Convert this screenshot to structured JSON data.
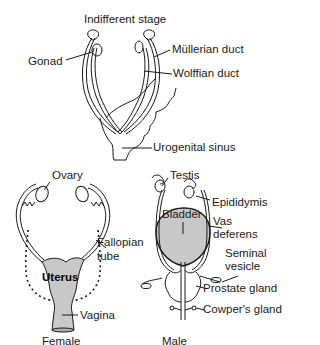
{
  "diagram": {
    "sections": {
      "indifferent": {
        "title": "Indifferent stage",
        "labels": {
          "gonad": "Gonad",
          "mullerian": "Müllerian duct",
          "wolffian": "Wolffian duct",
          "urogenital": "Urogenital sinus"
        }
      },
      "female": {
        "caption": "Female",
        "labels": {
          "ovary": "Ovary",
          "fallopian_1": "Fallopian",
          "fallopian_2": "tube",
          "uterus": "Uterus",
          "vagina": "Vagina"
        }
      },
      "male": {
        "caption": "Male",
        "labels": {
          "testis": "Testis",
          "epididymis": "Epididymis",
          "bladder": "Bladder",
          "vas_1": "Vas",
          "vas_2": "deferens",
          "seminal_1": "Seminal",
          "seminal_2": "vesicle",
          "prostate": "Prostate gland",
          "cowper": "Cowper's gland"
        }
      }
    },
    "colors": {
      "line": "#1a1a1a",
      "organ_fill": "#c8c8c8",
      "background": "#ffffff"
    }
  }
}
